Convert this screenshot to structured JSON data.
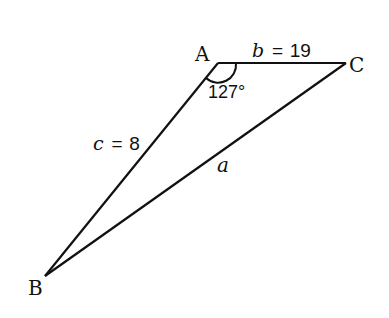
{
  "diagram": {
    "vertices": {
      "A": {
        "label": "A"
      },
      "B": {
        "label": "B"
      },
      "C": {
        "label": "C"
      }
    },
    "sides": {
      "b": {
        "var": "b",
        "eq": "=",
        "value": "19",
        "between": [
          "A",
          "C"
        ]
      },
      "c": {
        "var": "c",
        "eq": "=",
        "value": "8",
        "between": [
          "A",
          "B"
        ]
      },
      "a": {
        "var": "a",
        "between": [
          "B",
          "C"
        ]
      }
    },
    "angle_A": {
      "label": "127°",
      "value_deg": 127
    }
  }
}
